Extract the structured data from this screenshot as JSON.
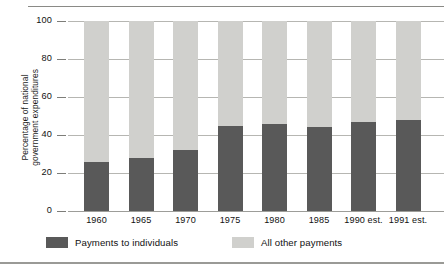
{
  "chart_data": {
    "type": "bar",
    "subtype": "stacked-100-percent",
    "title": "",
    "xlabel": "",
    "ylabel": "Percentage of national government expenditures",
    "ylabel_lines": [
      "Percentage of national",
      "government expenditures"
    ],
    "categories": [
      "1960",
      "1965",
      "1970",
      "1975",
      "1980",
      "1985",
      "1990 est.",
      "1991 est."
    ],
    "ylim": [
      0,
      100
    ],
    "yticks": [
      "0",
      "20",
      "40",
      "60",
      "80",
      "100"
    ],
    "grid": true,
    "legend_position": "bottom",
    "series": [
      {
        "name": "Payments to individuals",
        "color": "#595959",
        "values": [
          26,
          28,
          32,
          45,
          46,
          44,
          47,
          48
        ]
      },
      {
        "name": "All other payments",
        "color": "#d0d0cd",
        "values": [
          74,
          72,
          68,
          55,
          54,
          56,
          53,
          52
        ]
      }
    ]
  },
  "legend": {
    "items": [
      {
        "label": "Payments to individuals",
        "swatch": "dark"
      },
      {
        "label": "All other payments",
        "swatch": "light"
      }
    ]
  }
}
